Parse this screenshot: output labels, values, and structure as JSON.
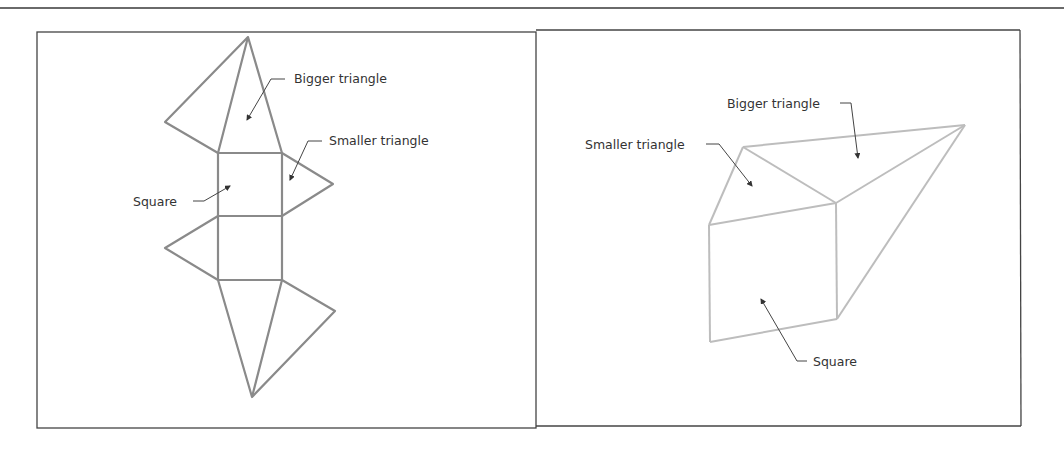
{
  "figure": {
    "colors": {
      "frame": "#444444",
      "net_line": "#8a8a8a",
      "prism_line": "#b8b8b8",
      "leader": "#444444",
      "text": "#333333"
    },
    "left_panel": {
      "description": "Net of a triangular-based shape (unfolded)",
      "labels": {
        "bigger_triangle": "Bigger triangle",
        "smaller_triangle": "Smaller triangle",
        "square": "Square"
      }
    },
    "right_panel": {
      "description": "Folded 3D shape",
      "labels": {
        "bigger_triangle": "Bigger triangle",
        "smaller_triangle": "Smaller triangle",
        "square": "Square"
      }
    }
  }
}
